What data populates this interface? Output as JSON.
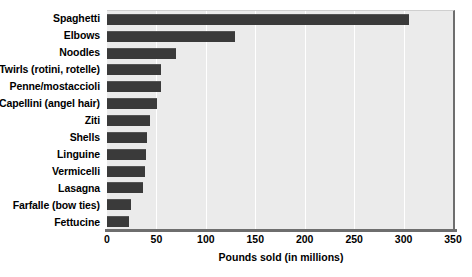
{
  "chart_data": {
    "type": "bar",
    "orientation": "horizontal",
    "title": "",
    "xlabel": "Pounds sold (in millions)",
    "ylabel": "",
    "xlim": [
      0,
      350
    ],
    "xticks": [
      0,
      50,
      100,
      150,
      200,
      250,
      300,
      350
    ],
    "grid": true,
    "legend": false,
    "bar_color": "#3a3a3a",
    "plot_background": "#ebebeb",
    "categories": [
      "Spaghetti",
      "Elbows",
      "Noodles",
      "Twirls (rotini, rotelle)",
      "Penne/mostaccioli",
      "Capellini (angel hair)",
      "Ziti",
      "Shells",
      "Linguine",
      "Vermicelli",
      "Lasagna",
      "Farfalle (bow ties)",
      "Fettucine"
    ],
    "values": [
      305,
      129,
      70,
      55,
      55,
      51,
      43,
      40,
      39,
      38,
      36,
      24,
      22
    ]
  }
}
